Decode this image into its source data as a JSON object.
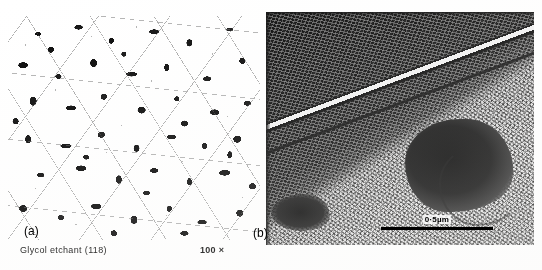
{
  "figure": {
    "type": "two-panel-micrograph-plate",
    "background_color": "#ffffff",
    "width": 542,
    "height": 270
  },
  "panels": [
    {
      "id": "a",
      "label": "(a)",
      "kind": "optical-micrograph",
      "description": "Equiaxed grain structure, light grains with dark grain-boundary precipitates",
      "magnification": "100 ×",
      "etchant": "Glycol etchant (118)",
      "dominant_colors": {
        "matrix": "#ffffff",
        "precipitate": "#0b0b0b",
        "boundary": "#5a5a5a"
      }
    },
    {
      "id": "b",
      "label": "(b)",
      "kind": "electron-micrograph",
      "description": "High magnification view showing a bright diagonal lath boundary separating a dark upper field from a lighter mottled lower field, with a dark second-phase region at lower right",
      "scale_bar": {
        "label": "0·5µm",
        "length_px": 112
      },
      "dominant_colors": {
        "dark_field": "#141414",
        "light_field": "#d8d8d8",
        "highlight": "#f2f2f2"
      }
    }
  ],
  "caption": {
    "etchant": "Glycol  etchant  (118)",
    "magnification": "100 ×"
  }
}
